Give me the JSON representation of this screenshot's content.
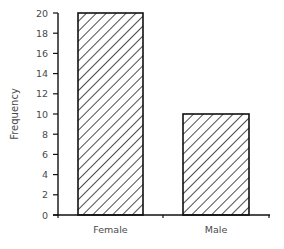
{
  "chart_data": {
    "type": "bar",
    "title": "",
    "xlabel": "",
    "ylabel": "Frequency",
    "categories": [
      "Female",
      "Male"
    ],
    "values": [
      20,
      10
    ],
    "ylim": [
      0,
      20
    ],
    "yticks": [
      0,
      2,
      4,
      6,
      8,
      10,
      12,
      14,
      16,
      18,
      20
    ],
    "grid": false,
    "legend": null,
    "bar_fill": "diagonal-hatch",
    "colors": {
      "bar_stroke": "#111111",
      "hatch": "#222222",
      "axis": "#111111",
      "text": "#4a4a4a"
    }
  }
}
